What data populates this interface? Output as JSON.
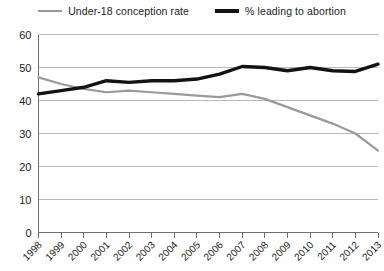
{
  "chart_data": {
    "type": "line",
    "title": "",
    "xlabel": "",
    "ylabel": "",
    "ylim": [
      0,
      60
    ],
    "ytick_step": 10,
    "yticks": [
      "0",
      "10",
      "20",
      "30",
      "40",
      "50",
      "60"
    ],
    "grid": true,
    "legend_position": "top-center",
    "categories": [
      "1998",
      "1999",
      "2000",
      "2001",
      "2002",
      "2003",
      "2004",
      "2005",
      "2006",
      "2007",
      "2008",
      "2009",
      "2010",
      "2011",
      "2012",
      "2013"
    ],
    "series": [
      {
        "name": "Under-18 conception rate",
        "color": "#9a9a9a",
        "width": 2.2,
        "values": [
          47.0,
          45.0,
          43.5,
          42.5,
          43.0,
          42.5,
          42.0,
          41.5,
          41.0,
          42.0,
          40.5,
          38.0,
          35.5,
          33.0,
          30.0,
          24.8
        ]
      },
      {
        "name": "% leading to abortion",
        "color": "#131313",
        "width": 3.4,
        "values": [
          42.0,
          43.0,
          44.0,
          46.0,
          45.5,
          46.0,
          46.0,
          46.5,
          48.0,
          50.3,
          50.0,
          49.0,
          50.0,
          49.0,
          48.8,
          51.0
        ]
      }
    ]
  },
  "legend": {
    "entries": [
      {
        "label": "Under-18 conception rate"
      },
      {
        "label": "% leading to abortion"
      }
    ]
  }
}
